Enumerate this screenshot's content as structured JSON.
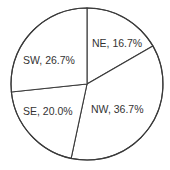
{
  "chart_data": {
    "type": "pie",
    "title": "",
    "start_angle_deg": 0,
    "direction": "clockwise",
    "categories": [
      "NE",
      "NW",
      "SE",
      "SW"
    ],
    "values": [
      16.7,
      36.7,
      20.0,
      26.7
    ],
    "labels": [
      "NE, 16.7%",
      "NW, 36.7%",
      "SE, 20.0%",
      "SW, 26.7%"
    ],
    "legend": "none",
    "colors": [
      "#ffffff",
      "#ffffff",
      "#ffffff",
      "#ffffff"
    ],
    "stroke_color": "#3a3a3a"
  },
  "geometry": {
    "cx": 87,
    "cy": 84,
    "r": 76
  },
  "label_positions": [
    {
      "x": 92,
      "y": 47
    },
    {
      "x": 91,
      "y": 113
    },
    {
      "x": 23,
      "y": 115
    },
    {
      "x": 23,
      "y": 64
    }
  ]
}
